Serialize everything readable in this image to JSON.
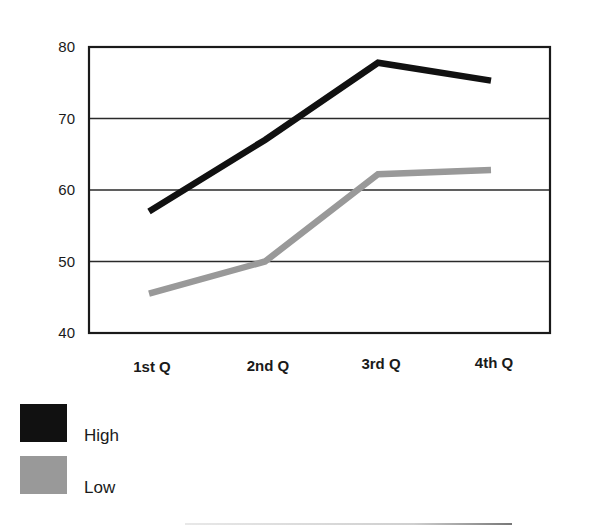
{
  "chart_data": {
    "type": "line",
    "title": "",
    "xlabel": "",
    "ylabel": "",
    "categories": [
      "1st Q",
      "2nd Q",
      "3rd Q",
      "4th Q"
    ],
    "series": [
      {
        "name": "High",
        "color": "#111111",
        "values": [
          57,
          67,
          77.8,
          75.3
        ]
      },
      {
        "name": "Low",
        "color": "#999999",
        "values": [
          45.5,
          50,
          62.2,
          62.8
        ]
      }
    ],
    "ylim": [
      40,
      80
    ],
    "yticks": [
      40,
      50,
      60,
      70,
      80
    ],
    "grid": true,
    "legend_position": "bottom-left"
  },
  "legend": {
    "items": [
      {
        "label": "High",
        "color": "#111111"
      },
      {
        "label": "Low",
        "color": "#999999"
      }
    ]
  }
}
